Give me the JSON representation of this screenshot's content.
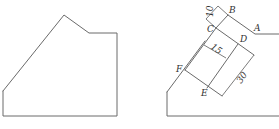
{
  "figure": {
    "left": {
      "description": "Original pentagonal-topped shape",
      "stroke_color": "#6a6a6a"
    },
    "right": {
      "description": "Same shape with internal construction lines and dimensions",
      "points": {
        "A": "A",
        "B": "B",
        "C": "C",
        "D": "D",
        "E": "E",
        "F": "F"
      },
      "dimensions": {
        "bc": "10",
        "cd_width": "15",
        "de_length": "30"
      },
      "stroke_color": "#6a6a6a"
    }
  }
}
